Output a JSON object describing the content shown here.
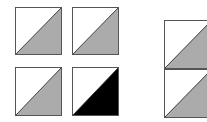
{
  "diagram": {
    "colors": {
      "background": "#ffffff",
      "border": "#555555",
      "gray_fill": "#ababab",
      "black_fill": "#000000",
      "white_fill": "#ffffff"
    },
    "left_grid": {
      "tiles": [
        {
          "id": "tile-1",
          "fill": "#ababab",
          "x": 15,
          "y": 7,
          "w": 47,
          "h": 48
        },
        {
          "id": "tile-2",
          "fill": "#ababab",
          "x": 72,
          "y": 7,
          "w": 47,
          "h": 48
        },
        {
          "id": "tile-3",
          "fill": "#ababab",
          "x": 15,
          "y": 67,
          "w": 47,
          "h": 49
        },
        {
          "id": "tile-4",
          "fill": "#000000",
          "x": 72,
          "y": 67,
          "w": 47,
          "h": 49
        }
      ]
    },
    "right_stack": {
      "tiles": [
        {
          "id": "tile-5",
          "fill": "#ababab",
          "x": 164,
          "y": 20,
          "w": 48,
          "h": 49
        },
        {
          "id": "tile-6",
          "fill": "#ababab",
          "x": 164,
          "y": 69,
          "w": 48,
          "h": 49
        }
      ]
    }
  }
}
